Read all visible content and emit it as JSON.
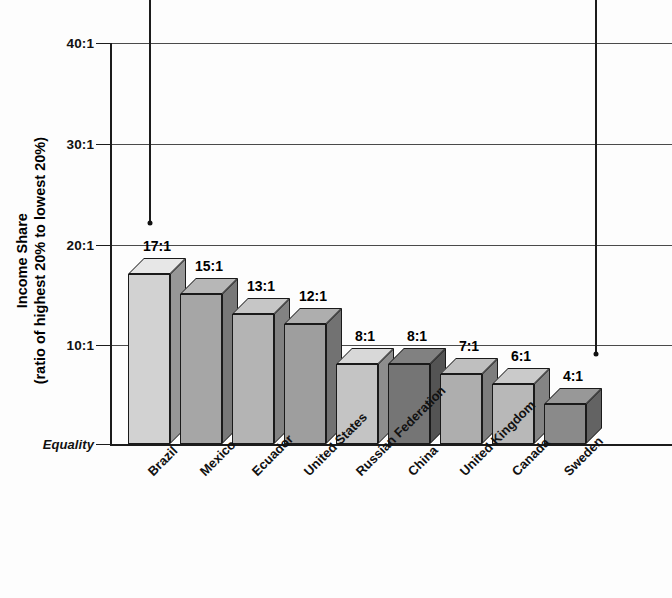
{
  "chart_data": {
    "type": "bar",
    "title": "",
    "xlabel": "",
    "ylabel": "Income Share (ratio of highest 20% to lowest 20%)",
    "ylabel_line1": "Income Share",
    "ylabel_line2": "(ratio of highest 20% to lowest 20%)",
    "categories": [
      "Brazil",
      "Mexico",
      "Ecuador",
      "United States",
      "Russian Federation",
      "China",
      "United Kingdom",
      "Canada",
      "Sweden"
    ],
    "values": [
      17,
      15,
      13,
      12,
      8,
      8,
      7,
      6,
      4
    ],
    "value_labels": [
      "17:1",
      "15:1",
      "13:1",
      "12:1",
      "8:1",
      "8:1",
      "7:1",
      "6:1",
      "4:1"
    ],
    "bar_colors": [
      "#d2d2d2",
      "#a6a6a6",
      "#b4b4b4",
      "#9e9e9e",
      "#c4c4c4",
      "#757575",
      "#aeaeae",
      "#b8b8b8",
      "#8a8a8a"
    ],
    "ylim": [
      0,
      40
    ],
    "yticks": [
      40,
      30,
      20,
      10,
      0
    ],
    "ytick_labels": [
      "40:1",
      "30:1",
      "20:1",
      "10:1",
      "Equality"
    ],
    "grid": true,
    "legend": "none",
    "annotations": [
      {
        "name": "left-leader-line",
        "x_value_index": 0,
        "points_to_value": 22
      },
      {
        "name": "right-leader-line",
        "x_value_index": 8,
        "points_to_value": 9
      }
    ]
  },
  "top_caption": "",
  "accent_colors": {
    "axis": "#1c1c1c",
    "gridline": "#4a4a4a",
    "text": "#111111",
    "background": "#fdfdfd"
  }
}
